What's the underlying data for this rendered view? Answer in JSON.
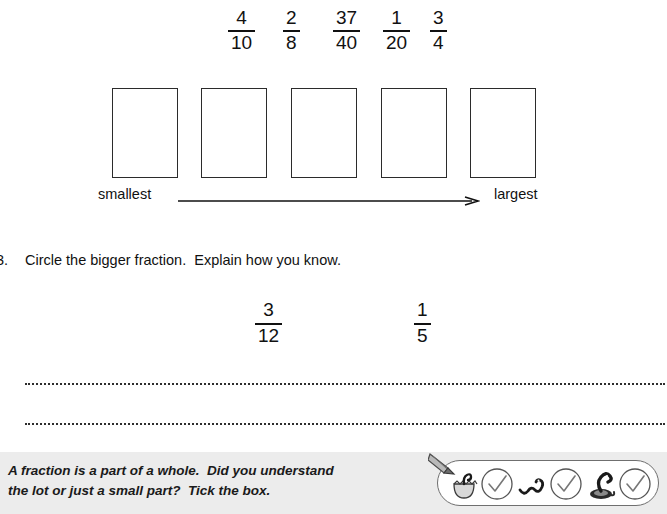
{
  "worksheet": {
    "ordering_task": {
      "fractions": [
        {
          "numerator": "4",
          "denominator": "10",
          "x": 228
        },
        {
          "numerator": "2",
          "denominator": "8",
          "x": 283
        },
        {
          "numerator": "37",
          "denominator": "40",
          "x": 333
        },
        {
          "numerator": "1",
          "denominator": "20",
          "x": 383
        },
        {
          "numerator": "3",
          "denominator": "4",
          "x": 430
        }
      ],
      "boxes": [
        {
          "x": 112
        },
        {
          "x": 201
        },
        {
          "x": 291
        },
        {
          "x": 381
        },
        {
          "x": 470
        }
      ],
      "scale": {
        "smallest_label": "smallest",
        "largest_label": "largest",
        "arrow_direction": "right"
      }
    },
    "question": {
      "number": "3.",
      "text": "Circle the bigger fraction.  Explain how you know.",
      "compare_fractions": [
        {
          "numerator": "3",
          "denominator": "12",
          "x": 255
        },
        {
          "numerator": "1",
          "denominator": "5",
          "x": 414
        }
      ],
      "answer_lines": 2
    },
    "footer": {
      "prompt_line_1": "A fraction is a part of a whole.  Did you understand",
      "prompt_line_2": "the lot or just a small part?  Tick the box.",
      "pencil_icon": "pencil-icon",
      "tick_options": [
        {
          "icon": "snake-hatching-icon",
          "tick": "tick-circle-icon",
          "x": 10
        },
        {
          "icon": "snake-small-icon",
          "tick": "tick-circle-icon",
          "x": 79
        },
        {
          "icon": "snake-coiled-icon",
          "tick": "tick-circle-icon",
          "x": 148
        }
      ]
    },
    "colors": {
      "ink": "#111111",
      "box_border": "#2b2b2b",
      "footer_background": "#ececec",
      "panel_border": "#6f6f6f"
    }
  }
}
